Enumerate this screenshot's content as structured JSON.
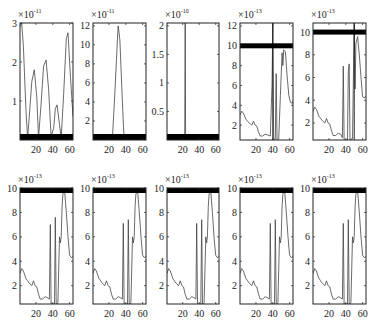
{
  "chart_data": [
    {
      "type": "line",
      "panel": 1,
      "row": 0,
      "col": 0,
      "exponent": "-11",
      "xticks": [
        20,
        40,
        60
      ],
      "xlim": [
        1,
        64
      ],
      "yticks": [
        1,
        2,
        3
      ],
      "ylim": [
        0,
        3.0
      ],
      "box": {
        "x": 20,
        "y": 23,
        "w": 53,
        "h": 117
      },
      "bar": {
        "y": 0.05,
        "thick": 6,
        "pos": "bottom"
      },
      "x": [
        1,
        3,
        5,
        8,
        10,
        12,
        15,
        18,
        21,
        23,
        26,
        29,
        32,
        35,
        38,
        41,
        43,
        45,
        48,
        50,
        53,
        56,
        58,
        61,
        64
      ],
      "y": [
        2.9,
        3.0,
        2.4,
        0.8,
        0.05,
        0.6,
        1.5,
        1.8,
        1.1,
        0.05,
        0.9,
        1.9,
        2.05,
        1.3,
        0.1,
        0.3,
        0.8,
        0.9,
        0.4,
        0.05,
        1.2,
        2.6,
        2.75,
        1.6,
        0.6
      ]
    },
    {
      "type": "line",
      "panel": 2,
      "row": 0,
      "col": 1,
      "exponent": "-11",
      "xticks": [
        20,
        40,
        60
      ],
      "xlim": [
        1,
        64
      ],
      "yticks": [
        2,
        4,
        6,
        8,
        10,
        12
      ],
      "ylim": [
        0,
        12.3
      ],
      "box": {
        "x": 93,
        "y": 23,
        "w": 53,
        "h": 117
      },
      "bar": {
        "y": 0.05,
        "thick": 6,
        "pos": "bottom"
      },
      "x": [
        1,
        24,
        27,
        30,
        31,
        33,
        36,
        38,
        64
      ],
      "y": [
        0,
        0,
        5,
        10.5,
        12,
        10.5,
        4,
        0,
        0
      ]
    },
    {
      "type": "line",
      "panel": 3,
      "row": 0,
      "col": 2,
      "exponent": "-10",
      "xticks": [
        20,
        40,
        60
      ],
      "xlim": [
        1,
        64
      ],
      "yticks": [
        0.5,
        1,
        1.5,
        2
      ],
      "ylim": [
        0,
        2.05
      ],
      "box": {
        "x": 167,
        "y": 23,
        "w": 52,
        "h": 117
      },
      "bar": {
        "y": 0.05,
        "thick": 6,
        "pos": "bottom"
      },
      "x": [
        1,
        22.5,
        23,
        23.5,
        64
      ],
      "y": [
        0,
        0,
        2.05,
        0,
        0
      ]
    },
    {
      "type": "line",
      "panel": 4,
      "row": 0,
      "col": 3,
      "exponent": "-13",
      "xticks": [
        20,
        40,
        60
      ],
      "xlim": [
        1,
        64
      ],
      "yticks": [
        2,
        4,
        6,
        8,
        10,
        12
      ],
      "ylim": [
        0.5,
        12.3
      ],
      "box": {
        "x": 240,
        "y": 23,
        "w": 53,
        "h": 117
      },
      "bar": {
        "y": 10,
        "thick": 5,
        "pos": "level"
      },
      "vline": 40,
      "x": [
        1,
        3,
        5,
        8,
        10,
        12,
        15,
        17,
        19,
        21,
        23,
        25,
        28,
        31,
        34,
        37,
        39,
        40,
        41,
        43,
        44,
        45,
        46,
        47,
        49,
        51,
        52,
        53,
        55,
        57,
        59,
        61,
        63,
        64
      ],
      "y": [
        3.0,
        3.4,
        3.2,
        2.6,
        2.4,
        2.2,
        2.0,
        2.4,
        2.0,
        1.9,
        1.3,
        0.9,
        0.9,
        1.1,
        1.0,
        0.9,
        6.0,
        12.3,
        0.5,
        0.6,
        7.2,
        0.5,
        0.5,
        0.6,
        5.0,
        9.3,
        8.0,
        9.6,
        9.4,
        7.0,
        5.0,
        4.3,
        4.2,
        4.4
      ]
    },
    {
      "type": "line",
      "panel": 5,
      "row": 0,
      "col": 4,
      "exponent": "-13",
      "xticks": [
        20,
        40,
        60
      ],
      "xlim": [
        1,
        64
      ],
      "yticks": [
        2,
        4,
        6,
        8,
        10
      ],
      "ylim": [
        0.5,
        10.8
      ],
      "box": {
        "x": 313,
        "y": 23,
        "w": 53,
        "h": 117
      },
      "bar": {
        "y": 10,
        "thick": 5,
        "pos": "level"
      },
      "vline": 50,
      "x": [
        1,
        3,
        5,
        8,
        10,
        12,
        15,
        17,
        19,
        21,
        23,
        25,
        28,
        31,
        34,
        36,
        37,
        38,
        40,
        42,
        43,
        44,
        45,
        46,
        48,
        50,
        51,
        52,
        54,
        56,
        58,
        60,
        62,
        64
      ],
      "y": [
        3.0,
        3.4,
        3.2,
        2.6,
        2.4,
        2.2,
        2.0,
        2.4,
        2.0,
        1.9,
        1.3,
        0.9,
        0.9,
        1.1,
        1.0,
        0.7,
        7.0,
        0.5,
        0.5,
        0.5,
        6.5,
        7.2,
        0.5,
        0.6,
        0.6,
        10.8,
        5.0,
        9.0,
        9.6,
        8.0,
        6.0,
        4.3,
        4.2,
        4.4
      ]
    },
    {
      "type": "line",
      "panel": 6,
      "row": 1,
      "col": 0,
      "exponent": "-13",
      "xticks": [
        20,
        40,
        60
      ],
      "xlim": [
        1,
        64
      ],
      "yticks": [
        2,
        4,
        6,
        8,
        10
      ],
      "ylim": [
        0.5,
        10
      ],
      "box": {
        "x": 20,
        "y": 188,
        "w": 53,
        "h": 116
      },
      "bar": {
        "y": 10,
        "thick": 5,
        "pos": "top"
      },
      "x": [
        1,
        3,
        5,
        8,
        10,
        12,
        15,
        17,
        19,
        21,
        23,
        25,
        28,
        31,
        34,
        36,
        37,
        38,
        40,
        42,
        43,
        44,
        45,
        46,
        48,
        49,
        50,
        51,
        52,
        54,
        56,
        58,
        60,
        62,
        64
      ],
      "y": [
        3.0,
        3.4,
        3.2,
        2.6,
        2.4,
        2.2,
        2.0,
        2.4,
        2.0,
        1.9,
        1.3,
        0.9,
        0.9,
        1.1,
        1.0,
        0.9,
        7.0,
        0.5,
        0.5,
        0.5,
        7.6,
        0.5,
        0.5,
        0.6,
        6.0,
        5.5,
        6.0,
        8.5,
        9.5,
        9.8,
        8.0,
        6.0,
        4.5,
        4.3,
        4.4
      ]
    },
    {
      "type": "line",
      "panel": 7,
      "row": 1,
      "col": 1,
      "exponent": "-13",
      "xticks": [
        20,
        40,
        60
      ],
      "xlim": [
        1,
        64
      ],
      "yticks": [
        2,
        4,
        6,
        8,
        10
      ],
      "ylim": [
        0.5,
        10
      ],
      "box": {
        "x": 93,
        "y": 188,
        "w": 53,
        "h": 116
      },
      "bar": {
        "y": 10,
        "thick": 5,
        "pos": "top"
      },
      "x": [
        1,
        3,
        5,
        8,
        10,
        12,
        15,
        17,
        19,
        21,
        23,
        25,
        28,
        31,
        34,
        36,
        37,
        38,
        40,
        42,
        43,
        44,
        45,
        46,
        48,
        49,
        50,
        51,
        52,
        54,
        56,
        58,
        60,
        62,
        64
      ],
      "y": [
        3.0,
        3.4,
        3.2,
        2.6,
        2.4,
        2.2,
        2.0,
        2.4,
        2.0,
        1.9,
        1.3,
        0.9,
        0.9,
        1.1,
        1.0,
        0.9,
        7.1,
        0.5,
        0.5,
        0.5,
        7.4,
        0.5,
        0.5,
        0.6,
        6.0,
        5.5,
        6.0,
        8.5,
        9.5,
        9.8,
        8.0,
        6.0,
        4.5,
        4.3,
        4.4
      ]
    },
    {
      "type": "line",
      "panel": 8,
      "row": 1,
      "col": 2,
      "exponent": "-13",
      "xticks": [
        20,
        40,
        60
      ],
      "xlim": [
        1,
        64
      ],
      "yticks": [
        2,
        4,
        6,
        8,
        10
      ],
      "ylim": [
        0.5,
        10
      ],
      "box": {
        "x": 167,
        "y": 188,
        "w": 52,
        "h": 116
      },
      "bar": {
        "y": 10,
        "thick": 5,
        "pos": "top"
      },
      "x": [
        1,
        3,
        5,
        8,
        10,
        12,
        15,
        17,
        19,
        21,
        23,
        25,
        28,
        31,
        34,
        36,
        37,
        38,
        40,
        42,
        43,
        44,
        45,
        46,
        48,
        49,
        50,
        51,
        52,
        54,
        56,
        58,
        60,
        62,
        64
      ],
      "y": [
        3.0,
        3.4,
        3.2,
        2.6,
        2.4,
        2.2,
        2.0,
        2.4,
        2.0,
        1.9,
        1.3,
        0.9,
        0.9,
        1.1,
        1.0,
        0.9,
        7.1,
        0.5,
        0.5,
        0.5,
        7.4,
        0.5,
        0.5,
        0.6,
        6.0,
        5.5,
        6.0,
        8.5,
        9.5,
        9.8,
        8.0,
        6.0,
        4.5,
        4.3,
        4.4
      ]
    },
    {
      "type": "line",
      "panel": 9,
      "row": 1,
      "col": 3,
      "exponent": "-13",
      "xticks": [
        20,
        40,
        60
      ],
      "xlim": [
        1,
        64
      ],
      "yticks": [
        2,
        4,
        6,
        8,
        10
      ],
      "ylim": [
        0.5,
        10
      ],
      "box": {
        "x": 240,
        "y": 188,
        "w": 53,
        "h": 116
      },
      "bar": {
        "y": 10,
        "thick": 5,
        "pos": "top"
      },
      "x": [
        1,
        3,
        5,
        8,
        10,
        12,
        15,
        17,
        19,
        21,
        23,
        25,
        28,
        31,
        34,
        36,
        37,
        38,
        40,
        42,
        43,
        44,
        45,
        46,
        48,
        49,
        50,
        51,
        52,
        54,
        56,
        58,
        60,
        62,
        64
      ],
      "y": [
        3.0,
        3.4,
        3.2,
        2.6,
        2.4,
        2.2,
        2.0,
        2.4,
        2.0,
        1.9,
        1.3,
        0.9,
        0.9,
        1.1,
        1.0,
        0.9,
        7.1,
        0.5,
        0.5,
        0.5,
        7.4,
        0.5,
        0.5,
        0.6,
        6.0,
        5.5,
        6.0,
        8.5,
        9.5,
        9.8,
        8.0,
        6.0,
        4.5,
        4.3,
        4.4
      ]
    },
    {
      "type": "line",
      "panel": 10,
      "row": 1,
      "col": 4,
      "exponent": "-13",
      "xticks": [
        20,
        40,
        60
      ],
      "xlim": [
        1,
        64
      ],
      "yticks": [
        2,
        4,
        6,
        8,
        10
      ],
      "ylim": [
        0.5,
        10
      ],
      "box": {
        "x": 313,
        "y": 188,
        "w": 53,
        "h": 116
      },
      "bar": {
        "y": 10,
        "thick": 5,
        "pos": "top"
      },
      "x": [
        1,
        3,
        5,
        8,
        10,
        12,
        15,
        17,
        19,
        21,
        23,
        25,
        28,
        31,
        34,
        36,
        37,
        38,
        40,
        42,
        43,
        44,
        45,
        46,
        48,
        49,
        50,
        51,
        52,
        54,
        56,
        58,
        60,
        62,
        64
      ],
      "y": [
        3.0,
        3.4,
        3.2,
        2.6,
        2.4,
        2.2,
        2.0,
        2.4,
        2.0,
        1.9,
        1.3,
        0.9,
        0.9,
        1.1,
        1.0,
        0.9,
        7.1,
        0.5,
        0.5,
        0.5,
        7.4,
        0.5,
        0.5,
        0.6,
        6.0,
        5.5,
        6.0,
        8.5,
        9.5,
        9.8,
        8.0,
        6.0,
        4.5,
        4.3,
        4.4
      ]
    }
  ],
  "style": {
    "line_color": "#444444",
    "axis_color": "#222222",
    "bar_color": "#000000",
    "background": "#ffffff"
  },
  "labels": {
    "exponent_prefix": "×10"
  }
}
